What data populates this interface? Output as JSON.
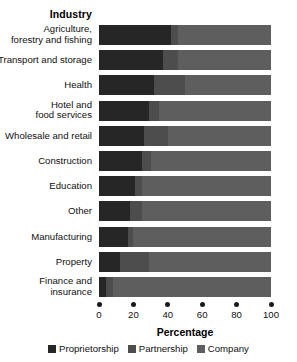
{
  "heading": "Industry",
  "axis_title": "Percentage",
  "legend": [
    {
      "label": "Proprietorship",
      "color": "#262626"
    },
    {
      "label": "Partnership",
      "color": "#4d4d4d"
    },
    {
      "label": "Company",
      "color": "#5e5e5e"
    }
  ],
  "ticks": [
    "0",
    "20",
    "40",
    "60",
    "80",
    "100"
  ],
  "chart_data": {
    "type": "bar",
    "orientation": "horizontal",
    "stacked": true,
    "stack_mode": "percent",
    "title": "Industry",
    "xlabel": "Percentage",
    "ylabel": "Industry",
    "xlim": [
      0,
      100
    ],
    "xticks": [
      0,
      20,
      40,
      60,
      80,
      100
    ],
    "grid": false,
    "legend_position": "bottom",
    "categories": [
      "Agriculture,\nforestry and fishing",
      "Transport and storage",
      "Health",
      "Hotel and\nfood services",
      "Wholesale and retail",
      "Construction",
      "Education",
      "Other",
      "Manufacturing",
      "Property",
      "Finance and\ninsurance"
    ],
    "series": [
      {
        "name": "Proprietorship",
        "color": "#262626",
        "values": [
          42,
          37,
          32,
          29,
          26,
          25,
          21,
          18,
          17,
          12,
          4
        ]
      },
      {
        "name": "Partnership",
        "color": "#4d4d4d",
        "values": [
          4,
          9,
          18,
          6,
          14,
          5,
          4,
          7,
          3,
          17,
          4
        ]
      },
      {
        "name": "Company",
        "color": "#5e5e5e",
        "values": [
          54,
          54,
          50,
          65,
          60,
          70,
          75,
          75,
          80,
          71,
          92
        ]
      }
    ]
  }
}
